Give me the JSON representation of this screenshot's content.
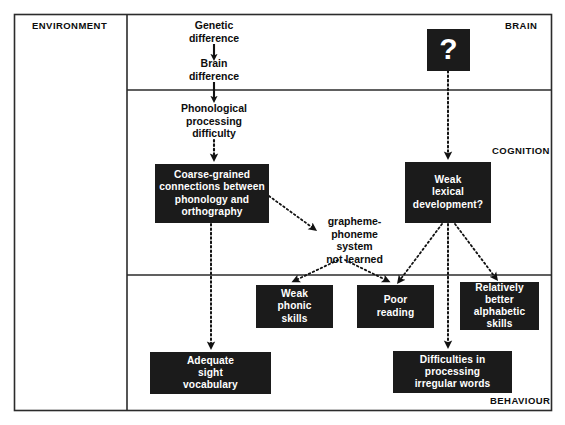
{
  "diagram": {
    "frame": {
      "stroke_color": "#2b2b2b"
    },
    "level_labels": [
      {
        "id": "environment",
        "text": "ENVIRONMENT"
      },
      {
        "id": "brain",
        "text": "BRAIN"
      },
      {
        "id": "cognition",
        "text": "COGNITION"
      },
      {
        "id": "behaviour",
        "text": "BEHAVIOUR"
      }
    ],
    "plain_nodes": [
      {
        "id": "genetic-difference",
        "text": "Genetic\ndifference"
      },
      {
        "id": "brain-difference",
        "text": "Brain\ndifference"
      },
      {
        "id": "phonological-processing-difficulty",
        "text": "Phonological\nprocessing\ndifficulty"
      },
      {
        "id": "grapheme-phoneme-system-not-learned",
        "text": "grapheme-\nphoneme\nsystem\nnot learned"
      }
    ],
    "boxes": [
      {
        "id": "question-mark",
        "text": "?"
      },
      {
        "id": "coarse-grained-connections",
        "text": "Coarse-grained\nconnections between\nphonology and\northography"
      },
      {
        "id": "weak-lexical-development",
        "text": "Weak\nlexical\ndevelopment?"
      },
      {
        "id": "weak-phonic-skills",
        "text": "Weak\nphonic\nskills"
      },
      {
        "id": "poor-reading",
        "text": "Poor\nreading"
      },
      {
        "id": "relatively-better-alphabetic-skills",
        "text": "Relatively\nbetter\nalphabetic\nskills"
      },
      {
        "id": "adequate-sight-vocabulary",
        "text": "Adequate\nsight\nvocabulary"
      },
      {
        "id": "difficulties-irregular-words",
        "text": "Difficulties in\nprocessing\nirregular words"
      }
    ],
    "connections": [
      {
        "id": "genetic-to-brain",
        "style": "solid",
        "from": "genetic-difference",
        "to": "brain-difference"
      },
      {
        "id": "brain-to-phonological",
        "style": "solid",
        "from": "brain-difference",
        "to": "phonological-processing-difficulty"
      },
      {
        "id": "phonological-to-coarse-grained",
        "style": "dotted",
        "from": "phonological-processing-difficulty",
        "to": "coarse-grained-connections"
      },
      {
        "id": "question-to-weak-lexical",
        "style": "dotted",
        "from": "question-mark",
        "to": "weak-lexical-development"
      },
      {
        "id": "coarse-grained-to-grapheme",
        "style": "dotted",
        "from": "coarse-grained-connections",
        "to": "grapheme-phoneme-system-not-learned"
      },
      {
        "id": "grapheme-to-weak-phonic",
        "style": "dotted",
        "from": "grapheme-phoneme-system-not-learned",
        "to": "weak-phonic-skills"
      },
      {
        "id": "grapheme-to-poor-reading",
        "style": "dotted",
        "from": "grapheme-phoneme-system-not-learned",
        "to": "poor-reading"
      },
      {
        "id": "coarse-grained-to-adequate-sight",
        "style": "dotted",
        "from": "coarse-grained-connections",
        "to": "adequate-sight-vocabulary"
      },
      {
        "id": "weak-lexical-to-poor-reading",
        "style": "dotted",
        "from": "weak-lexical-development",
        "to": "poor-reading"
      },
      {
        "id": "weak-lexical-to-relatively-better",
        "style": "dotted",
        "from": "weak-lexical-development",
        "to": "relatively-better-alphabetic-skills"
      },
      {
        "id": "weak-lexical-to-difficulties",
        "style": "dotted",
        "from": "weak-lexical-development",
        "to": "difficulties-irregular-words"
      }
    ]
  }
}
